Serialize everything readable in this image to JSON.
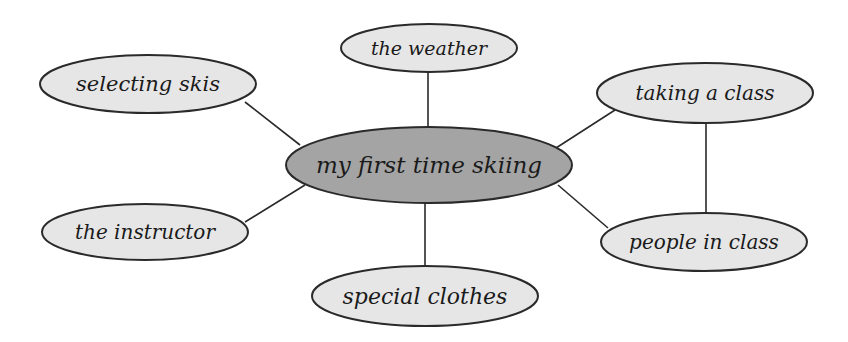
{
  "diagram": {
    "type": "web / mind map",
    "colors": {
      "background": "#ffffff",
      "center_fill": "#a4a4a4",
      "node_fill": "#e6e6e6",
      "stroke": "#2a2a2a",
      "text": "#1a1a1a"
    },
    "center": {
      "label": "my first time skiing"
    },
    "nodes": [
      {
        "id": "weather",
        "label": "the weather"
      },
      {
        "id": "skis",
        "label": "selecting skis"
      },
      {
        "id": "class",
        "label": "taking a class"
      },
      {
        "id": "instructor",
        "label": "the instructor"
      },
      {
        "id": "people",
        "label": "people in class"
      },
      {
        "id": "clothes",
        "label": "special clothes"
      }
    ],
    "edges": [
      [
        "my first time skiing",
        "the weather"
      ],
      [
        "my first time skiing",
        "selecting skis"
      ],
      [
        "my first time skiing",
        "taking a class"
      ],
      [
        "my first time skiing",
        "the instructor"
      ],
      [
        "my first time skiing",
        "people in class"
      ],
      [
        "my first time skiing",
        "special clothes"
      ],
      [
        "taking a class",
        "people in class"
      ]
    ]
  }
}
